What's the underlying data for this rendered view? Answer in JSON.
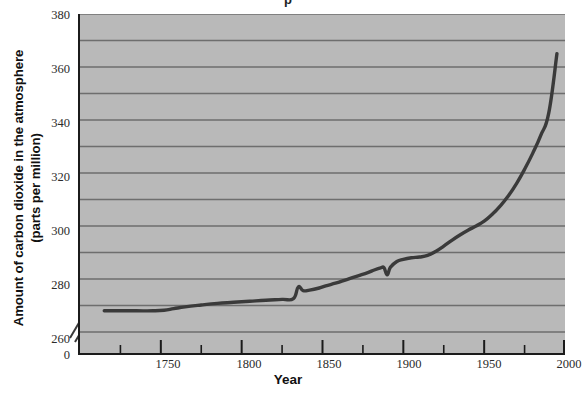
{
  "figure": {
    "title_fragment": "p",
    "x_axis_title": "Year",
    "y_axis_title_line1": "Amount of carbon dioxide in the atmosphere",
    "y_axis_title_line2": "(parts per million)",
    "plot_background_color": "#b9b9b9",
    "gridline_color": "#6e6e6e",
    "series_color": "#3a3a3a",
    "axis_color": "#1b1b1b"
  },
  "chart_data": {
    "type": "line",
    "title": "",
    "xlabel": "Year",
    "ylabel": "Amount of carbon dioxide in the atmosphere (parts per million)",
    "xlim": [
      1700,
      2000
    ],
    "ylim": [
      255,
      380
    ],
    "y_axis_break": true,
    "y_axis_break_note": "Axis broken between 0 and 260",
    "grid": true,
    "grid_interval": 10,
    "legend": "none",
    "x_ticks_major": [
      1750,
      1800,
      1850,
      1900,
      1950,
      2000
    ],
    "x_ticks_minor": [
      1725,
      1775,
      1825,
      1875,
      1925,
      1975
    ],
    "x_tick_labels": [
      "1750",
      "1800",
      "1850",
      "1900",
      "1950",
      "2000"
    ],
    "y_ticks_major": [
      260,
      280,
      300,
      320,
      340,
      360,
      380
    ],
    "y_tick_labels": [
      "260",
      "280",
      "300",
      "320",
      "340",
      "360",
      "380"
    ],
    "y_zero_label": "0",
    "y_gridlines": [
      260,
      270,
      280,
      290,
      300,
      310,
      320,
      330,
      340,
      350,
      360,
      370,
      380
    ],
    "series": [
      {
        "name": "Atmospheric CO2",
        "color": "#3a3a3a",
        "x": [
          1715,
          1725,
          1735,
          1745,
          1752,
          1758,
          1765,
          1775,
          1785,
          1795,
          1805,
          1815,
          1825,
          1832,
          1835,
          1838,
          1842,
          1848,
          1852,
          1858,
          1862,
          1868,
          1872,
          1878,
          1882,
          1886,
          1888,
          1890,
          1892,
          1896,
          1900,
          1905,
          1910,
          1915,
          1920,
          1925,
          1930,
          1935,
          1940,
          1945,
          1950,
          1955,
          1960,
          1965,
          1970,
          1975,
          1980,
          1985,
          1990,
          1995
        ],
        "y": [
          268.0,
          268.0,
          268.0,
          268.0,
          268.2,
          268.8,
          269.5,
          270.2,
          270.8,
          271.2,
          271.6,
          272.0,
          272.3,
          272.6,
          277.0,
          275.6,
          275.8,
          276.6,
          277.4,
          278.4,
          279.2,
          280.4,
          281.2,
          282.4,
          283.4,
          284.2,
          284.3,
          281.6,
          284.4,
          286.6,
          287.4,
          288.0,
          288.3,
          288.9,
          290.4,
          292.4,
          294.6,
          296.6,
          298.4,
          300.0,
          301.8,
          304.4,
          307.6,
          311.4,
          316.0,
          321.4,
          327.4,
          334.2,
          342.8,
          365.0
        ]
      }
    ]
  },
  "y_tick_positions": [
    {
      "label": "380",
      "top": 8
    },
    {
      "label": "360",
      "top": 62
    },
    {
      "label": "340",
      "top": 116
    },
    {
      "label": "320",
      "top": 170
    },
    {
      "label": "300",
      "top": 224
    },
    {
      "label": "280",
      "top": 278
    },
    {
      "label": "260",
      "top": 332
    },
    {
      "label": "0",
      "top": 348
    }
  ],
  "x_tick_positions": [
    {
      "label": "1750",
      "left": 168
    },
    {
      "label": "1800",
      "left": 249
    },
    {
      "label": "1850",
      "left": 329
    },
    {
      "label": "1900",
      "left": 409
    },
    {
      "label": "1950",
      "left": 489
    },
    {
      "label": "2000",
      "left": 569
    }
  ]
}
